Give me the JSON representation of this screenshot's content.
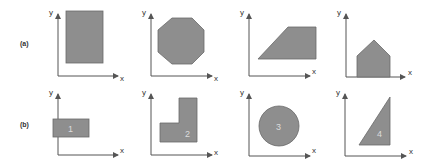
{
  "figure": {
    "rows": [
      {
        "label": "(a)",
        "panels": [
          {
            "shape": "rectangle",
            "x_label": "x",
            "y_label": "y"
          },
          {
            "shape": "octagon",
            "x_label": "x",
            "y_label": "y"
          },
          {
            "shape": "trapezoid",
            "x_label": "x",
            "y_label": "y"
          },
          {
            "shape": "pentagon-house",
            "x_label": "x",
            "y_label": "y"
          }
        ]
      },
      {
        "label": "(b)",
        "panels": [
          {
            "shape": "rectangle",
            "number": "1",
            "x_label": "x",
            "y_label": "y"
          },
          {
            "shape": "L-shape",
            "number": "2",
            "x_label": "x",
            "y_label": "y"
          },
          {
            "shape": "circle",
            "number": "3",
            "x_label": "x",
            "y_label": "y"
          },
          {
            "shape": "right-triangle",
            "number": "4",
            "x_label": "x",
            "y_label": "y"
          }
        ]
      }
    ],
    "colors": {
      "fill": "#8e8e8e",
      "axis": "#555555",
      "number": "#dcdcdc"
    }
  }
}
